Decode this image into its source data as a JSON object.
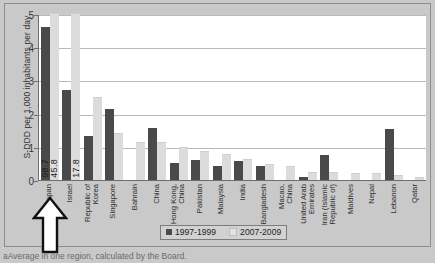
{
  "chart_data": {
    "type": "bar",
    "title": "",
    "xlabel": "",
    "ylabel": "S-DDD per 1,000 inhabitants per day",
    "ylim": [
      0,
      5
    ],
    "yticks": [
      0,
      1,
      2,
      3,
      4,
      5
    ],
    "grid": true,
    "legend_position": "bottom-center",
    "categories": [
      "Japan",
      "Israel",
      "Republic of\nKorea",
      "Singapore",
      "Bahrain",
      "China",
      "Hong Kong,\nChina",
      "Pakistan",
      "Malaysia",
      "India",
      "Bangladesh",
      "Macao,\nChina",
      "United Arab\nEmirates",
      "Iran (Islamic\nRepublic of)",
      "Maldives",
      "Nepal",
      "Lebanon",
      "Qatar"
    ],
    "series": [
      {
        "name": "1997-1999",
        "color": "#4a4a4a",
        "values": [
          4.62,
          2.72,
          1.33,
          2.15,
          0.0,
          1.56,
          0.52,
          0.6,
          0.43,
          0.56,
          0.41,
          0.0,
          0.1,
          0.74,
          0.0,
          0.0,
          1.55,
          0.0
        ]
      },
      {
        "name": "2007-2009",
        "color": "#dcdcdc",
        "values": [
          5.0,
          5.0,
          2.47,
          1.4,
          1.11,
          1.1,
          0.97,
          0.85,
          0.76,
          0.59,
          0.44,
          0.38,
          0.22,
          0.21,
          0.19,
          0.17,
          0.13,
          0.06
        ]
      }
    ],
    "overflow_labels": [
      {
        "category": "Japan",
        "series": "1997-1999",
        "value": "98.7"
      },
      {
        "category": "Japan",
        "series": "2007-2009",
        "value": "45.8"
      },
      {
        "category": "Israel",
        "series": "2007-2009",
        "value": "17.8"
      }
    ]
  },
  "legend": {
    "items": [
      {
        "label": "1997-1999"
      },
      {
        "label": "2007-2009"
      }
    ]
  },
  "annotation": {
    "arrow_target": "Japan"
  },
  "caption": {
    "text": "aAverage in one region, calculated by the Board."
  }
}
